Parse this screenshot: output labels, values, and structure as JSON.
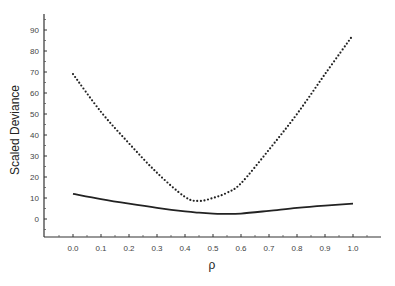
{
  "chart_data": {
    "type": "line",
    "title": "",
    "xlabel": "ρ",
    "ylabel": "Scaled Deviance",
    "xlim": [
      -0.104,
      1.1
    ],
    "ylim": [
      -8,
      98
    ],
    "grid": false,
    "legend": null,
    "x_ticks": [
      "0.0",
      "0.1",
      "0.2",
      "0.3",
      "0.4",
      "0.5",
      "0.6",
      "0.7",
      "0.8",
      "0.9",
      "1.0"
    ],
    "y_ticks": [
      "0",
      "10",
      "20",
      "30",
      "40",
      "50",
      "60",
      "70",
      "80",
      "90"
    ],
    "x": [
      0.0,
      0.1,
      0.2,
      0.3,
      0.4,
      0.45,
      0.5,
      0.55,
      0.6,
      0.7,
      0.8,
      0.9,
      1.0
    ],
    "series": [
      {
        "name": "dotted",
        "style": "dotted",
        "color": "#222222",
        "values": [
          69,
          51,
          36,
          22,
          10.5,
          8.6,
          10,
          12.5,
          17,
          33,
          50,
          69,
          87.6
        ]
      },
      {
        "name": "solid",
        "style": "solid",
        "color": "#222222",
        "values": [
          12,
          9.5,
          7.3,
          5.3,
          3.6,
          3.0,
          2.6,
          2.4,
          2.6,
          3.9,
          5.3,
          6.4,
          7.3
        ]
      }
    ]
  }
}
